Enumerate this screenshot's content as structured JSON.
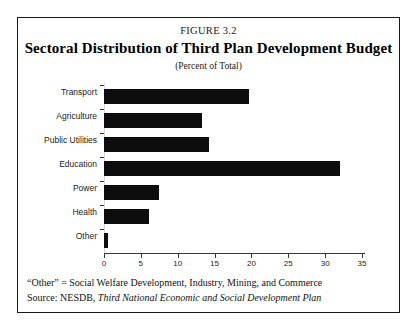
{
  "figure": {
    "number": "FIGURE 3.2",
    "title": "Sectoral Distribution of Third Plan Development Budget",
    "subtitle": "(Percent of Total)",
    "footnote_prefix": "“Other” = Social Welfare Development, Industry, Mining, and Commerce",
    "source_prefix": "Source: NESDB, ",
    "source_italic": "Third National Economic and Social Development Plan"
  },
  "chart_data": {
    "type": "bar",
    "orientation": "horizontal",
    "title": "Sectoral Distribution of Third Plan Development Budget",
    "subtitle": "(Percent of Total)",
    "xlabel": "",
    "ylabel": "",
    "xlim": [
      0,
      35
    ],
    "xticks": [
      0,
      5,
      10,
      15,
      20,
      25,
      30,
      35
    ],
    "xtick_labels": [
      "0",
      "5",
      "10",
      "15",
      "20",
      "25",
      "30",
      "35"
    ],
    "grid": false,
    "legend": null,
    "bar_color": "#0d0d0d",
    "categories": [
      "Transport",
      "Agriculture",
      "Public  Utilities",
      "Education",
      "Power",
      "Health",
      "Other"
    ],
    "values": [
      19.7,
      13.3,
      14.2,
      32.0,
      7.5,
      6.1,
      0.5
    ]
  }
}
